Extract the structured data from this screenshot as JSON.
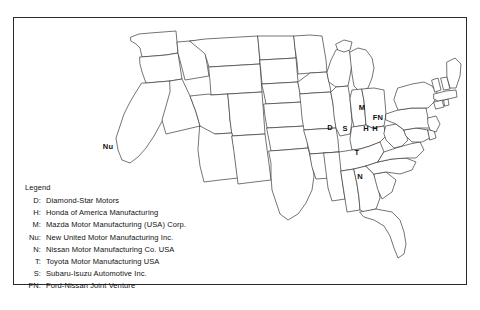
{
  "figure": {
    "type": "reference-map",
    "region": "United States (lower 48 states)",
    "frame_color": "#2b2b2b",
    "outline_color": "#3a3a3a",
    "background_color": "#ffffff",
    "text_color": "#111111"
  },
  "legend": {
    "title": "Legend",
    "entries": [
      {
        "abbr": "D:",
        "label": "Diamond-Star Motors"
      },
      {
        "abbr": "H:",
        "label": "Honda of America Manufacturing"
      },
      {
        "abbr": "M:",
        "label": "Mazda Motor Manufacturing (USA) Corp."
      },
      {
        "abbr": "Nu:",
        "label": "New United Motor Manufacturing Inc."
      },
      {
        "abbr": "N:",
        "label": "Nissan Motor Manufacturing Co. USA"
      },
      {
        "abbr": "T:",
        "label": "Toyota Motor Manufacturing USA"
      },
      {
        "abbr": "S:",
        "label": "Subaru-Isuzu Automotive Inc."
      },
      {
        "abbr": "FN:",
        "label": "Ford-Nissan Joint Venture"
      }
    ]
  },
  "markers": [
    {
      "code": "Nu",
      "x": 108,
      "y": 146
    },
    {
      "code": "D",
      "x": 330,
      "y": 127
    },
    {
      "code": "S",
      "x": 345,
      "y": 128
    },
    {
      "code": "M",
      "x": 362,
      "y": 107
    },
    {
      "code": "FN",
      "x": 378,
      "y": 117
    },
    {
      "code": "H",
      "x": 366,
      "y": 128
    },
    {
      "code": "H",
      "x": 375,
      "y": 128
    },
    {
      "code": "T",
      "x": 357,
      "y": 152
    },
    {
      "code": "N",
      "x": 360,
      "y": 176
    }
  ]
}
